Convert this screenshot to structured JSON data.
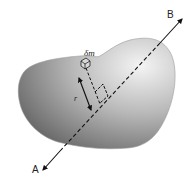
{
  "diagram": {
    "labels": {
      "axis_end_a": "A",
      "axis_end_b": "B",
      "mass_element": "δm",
      "distance": "r"
    },
    "body": {
      "shape": "irregular-blob",
      "fill_light": "#f2f2f2",
      "fill_dark": "#6e6e6e"
    },
    "axis": {
      "from": "A",
      "to": "B",
      "style": "dashed-inside-body",
      "arrows": "both-ends"
    },
    "perpendicular": {
      "from": "mass_element",
      "to": "axis",
      "style": "dashed",
      "right_angle_marker": true
    },
    "distance_arrow": {
      "label": "r",
      "arrows": "both-ends"
    },
    "colors": {
      "line": "#111111",
      "background": "#ffffff"
    }
  }
}
